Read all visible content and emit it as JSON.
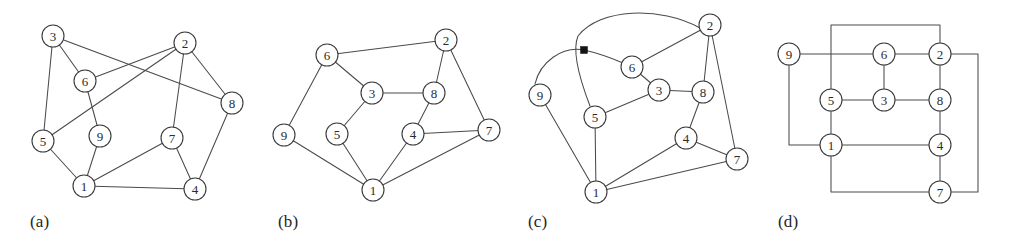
{
  "figure": {
    "width": 1012,
    "height": 248,
    "background_color": "#ffffff",
    "edge_color": "#4a4a4a",
    "node_fill_color": "#ffffff",
    "node_stroke_color": "#3a3a3a",
    "marker_color": "#141414"
  },
  "panels": [
    {
      "id": "panel-a",
      "caption": "(a)",
      "caption_x": 30,
      "caption_y": 212,
      "style": "straight-line drawing with edge crossings",
      "node_radius": 11,
      "nodes": [
        {
          "label": "3",
          "x": 53,
          "y": 36
        },
        {
          "label": "2",
          "x": 185,
          "y": 43
        },
        {
          "label": "6",
          "x": 85,
          "y": 81
        },
        {
          "label": "8",
          "x": 232,
          "y": 103
        },
        {
          "label": "5",
          "x": 43,
          "y": 141
        },
        {
          "label": "9",
          "x": 100,
          "y": 136
        },
        {
          "label": "7",
          "x": 172,
          "y": 138
        },
        {
          "label": "1",
          "x": 84,
          "y": 186
        },
        {
          "label": "4",
          "x": 195,
          "y": 189
        }
      ],
      "edges": [
        [
          "3",
          "6"
        ],
        [
          "3",
          "5"
        ],
        [
          "3",
          "8"
        ],
        [
          "2",
          "6"
        ],
        [
          "2",
          "5"
        ],
        [
          "2",
          "8"
        ],
        [
          "2",
          "7"
        ],
        [
          "6",
          "9"
        ],
        [
          "9",
          "1"
        ],
        [
          "5",
          "1"
        ],
        [
          "1",
          "7"
        ],
        [
          "1",
          "4"
        ],
        [
          "7",
          "4"
        ],
        [
          "4",
          "8"
        ]
      ]
    },
    {
      "id": "panel-b",
      "caption": "(b)",
      "caption_x": 278,
      "caption_y": 212,
      "style": "planar straight-line drawing, no crossings",
      "node_radius": 11,
      "nodes": [
        {
          "label": "2",
          "x": 446,
          "y": 40
        },
        {
          "label": "6",
          "x": 327,
          "y": 55
        },
        {
          "label": "3",
          "x": 372,
          "y": 93
        },
        {
          "label": "8",
          "x": 434,
          "y": 93
        },
        {
          "label": "9",
          "x": 284,
          "y": 135
        },
        {
          "label": "5",
          "x": 337,
          "y": 134
        },
        {
          "label": "4",
          "x": 413,
          "y": 134
        },
        {
          "label": "7",
          "x": 489,
          "y": 130
        },
        {
          "label": "1",
          "x": 373,
          "y": 190
        }
      ],
      "edges": [
        [
          "6",
          "2"
        ],
        [
          "6",
          "3"
        ],
        [
          "6",
          "9"
        ],
        [
          "2",
          "8"
        ],
        [
          "2",
          "7"
        ],
        [
          "3",
          "8"
        ],
        [
          "3",
          "5"
        ],
        [
          "8",
          "4"
        ],
        [
          "9",
          "1"
        ],
        [
          "5",
          "1"
        ],
        [
          "4",
          "1"
        ],
        [
          "4",
          "7"
        ],
        [
          "1",
          "7"
        ]
      ]
    },
    {
      "id": "panel-c",
      "caption": "(c)",
      "caption_x": 528,
      "caption_y": 212,
      "style": "curved-edge drawing with one marked crossing",
      "node_radius": 11,
      "nodes": [
        {
          "label": "2",
          "x": 710,
          "y": 25
        },
        {
          "label": "6",
          "x": 632,
          "y": 67
        },
        {
          "label": "3",
          "x": 659,
          "y": 90
        },
        {
          "label": "8",
          "x": 703,
          "y": 92
        },
        {
          "label": "9",
          "x": 540,
          "y": 95
        },
        {
          "label": "5",
          "x": 595,
          "y": 117
        },
        {
          "label": "4",
          "x": 686,
          "y": 138
        },
        {
          "label": "7",
          "x": 737,
          "y": 159
        },
        {
          "label": "1",
          "x": 596,
          "y": 192
        }
      ],
      "edges": [
        [
          "6",
          "2"
        ],
        [
          "6",
          "3"
        ],
        [
          "3",
          "8"
        ],
        [
          "3",
          "5"
        ],
        [
          "2",
          "8"
        ],
        [
          "2",
          "7"
        ],
        [
          "8",
          "4"
        ],
        [
          "4",
          "7"
        ],
        [
          "4",
          "1"
        ],
        [
          "5",
          "1"
        ],
        [
          "9",
          "1"
        ],
        [
          "1",
          "7"
        ]
      ],
      "curved_edges": [
        {
          "from": "9",
          "to": "6",
          "note": "arcs up over the crossing marker"
        },
        {
          "from": "2",
          "to": "5",
          "note": "long arc left over the top, through the crossing marker, down to 5"
        }
      ],
      "crossing_marker": {
        "x": 584,
        "y": 50,
        "size": 7,
        "shape": "filled-square"
      }
    },
    {
      "id": "panel-d",
      "caption": "(d)",
      "caption_x": 778,
      "caption_y": 212,
      "style": "orthogonal (rectilinear) grid drawing",
      "node_radius": 11,
      "nodes": [
        {
          "label": "9",
          "x": 789,
          "y": 54
        },
        {
          "label": "6",
          "x": 884,
          "y": 54
        },
        {
          "label": "2",
          "x": 940,
          "y": 54
        },
        {
          "label": "5",
          "x": 831,
          "y": 100
        },
        {
          "label": "3",
          "x": 884,
          "y": 100
        },
        {
          "label": "8",
          "x": 940,
          "y": 100
        },
        {
          "label": "1",
          "x": 831,
          "y": 145
        },
        {
          "label": "4",
          "x": 940,
          "y": 145
        },
        {
          "label": "7",
          "x": 940,
          "y": 192
        }
      ],
      "orthogonal_routes": [
        {
          "from": "9",
          "to": "6",
          "points": [
            [
              789,
              54
            ],
            [
              884,
              54
            ]
          ]
        },
        {
          "from": "6",
          "to": "2",
          "points": [
            [
              884,
              54
            ],
            [
              940,
              54
            ]
          ]
        },
        {
          "from": "6",
          "to": "3",
          "points": [
            [
              884,
              54
            ],
            [
              884,
              100
            ]
          ]
        },
        {
          "from": "5",
          "to": "3",
          "points": [
            [
              831,
              100
            ],
            [
              884,
              100
            ]
          ]
        },
        {
          "from": "3",
          "to": "8",
          "points": [
            [
              884,
              100
            ],
            [
              940,
              100
            ]
          ]
        },
        {
          "from": "2",
          "to": "8",
          "points": [
            [
              940,
              54
            ],
            [
              940,
              100
            ]
          ]
        },
        {
          "from": "8",
          "to": "4",
          "points": [
            [
              940,
              100
            ],
            [
              940,
              145
            ]
          ]
        },
        {
          "from": "5",
          "to": "1",
          "points": [
            [
              831,
              100
            ],
            [
              831,
              145
            ]
          ]
        },
        {
          "from": "1",
          "to": "4",
          "points": [
            [
              831,
              145
            ],
            [
              940,
              145
            ]
          ]
        },
        {
          "from": "4",
          "to": "7",
          "points": [
            [
              940,
              145
            ],
            [
              940,
              192
            ]
          ]
        },
        {
          "from": "9",
          "to": "1",
          "points": [
            [
              789,
              54
            ],
            [
              789,
              145
            ],
            [
              831,
              145
            ]
          ]
        },
        {
          "from": "5",
          "to": "2",
          "points": [
            [
              831,
              100
            ],
            [
              831,
              25
            ],
            [
              940,
              25
            ],
            [
              940,
              54
            ]
          ]
        },
        {
          "from": "1",
          "to": "7",
          "points": [
            [
              831,
              145
            ],
            [
              831,
              192
            ],
            [
              940,
              192
            ]
          ]
        },
        {
          "from": "7",
          "to": "2",
          "points": [
            [
              940,
              192
            ],
            [
              978,
              192
            ],
            [
              978,
              54
            ],
            [
              940,
              54
            ]
          ]
        }
      ]
    }
  ]
}
